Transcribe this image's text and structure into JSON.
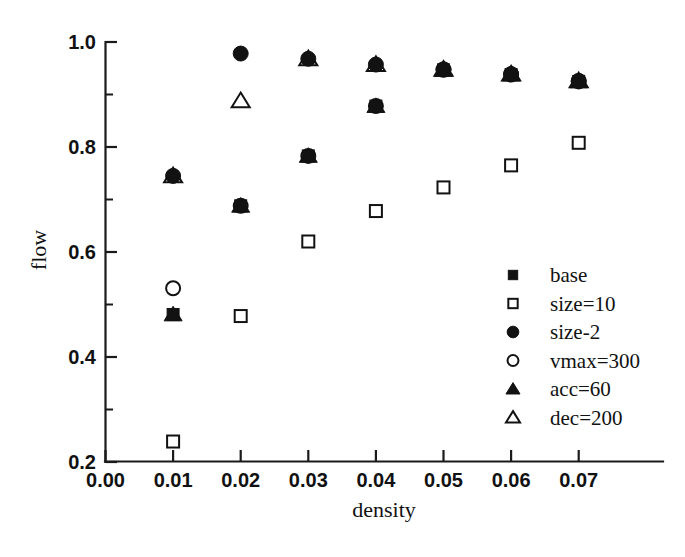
{
  "chart_data": {
    "type": "scatter",
    "title": "",
    "xlabel": "density",
    "ylabel": "flow",
    "xlim": [
      0.0,
      0.0815
    ],
    "ylim": [
      0.155,
      1.02
    ],
    "grid": false,
    "legend_position": "center-right",
    "x_ticks": [
      "0.00",
      "0.01",
      "0.02",
      "0.03",
      "0.04",
      "0.05",
      "0.06",
      "0.07"
    ],
    "x_tick_values": [
      0.0,
      0.01,
      0.02,
      0.03,
      0.04,
      0.05,
      0.06,
      0.07
    ],
    "y_ticks": [
      "0.2",
      "0.4",
      "0.6",
      "0.8",
      "1.0"
    ],
    "y_tick_values": [
      0.2,
      0.4,
      0.6,
      0.8,
      1.0
    ],
    "y_minor_ticks": [
      0.3,
      0.5,
      0.7,
      0.9
    ],
    "x": [
      0.01,
      0.02,
      0.03,
      0.04,
      0.05,
      0.06,
      0.07
    ],
    "series": [
      {
        "name": "base",
        "marker": "filled-square",
        "values": [
          0.481,
          0.688,
          0.783,
          0.878,
          0.947,
          0.938,
          0.925
        ]
      },
      {
        "name": "size=10",
        "marker": "open-square",
        "values": [
          0.239,
          0.478,
          0.62,
          0.678,
          0.723,
          0.765,
          0.808
        ]
      },
      {
        "name": "size-2",
        "marker": "filled-circle",
        "values": [
          0.745,
          0.978,
          0.968,
          0.957,
          0.948,
          0.939,
          0.926
        ]
      },
      {
        "name": "vmax=300",
        "marker": "open-circle",
        "values": [
          0.531,
          0.688,
          0.783,
          0.878,
          0.947,
          0.938,
          0.925
        ]
      },
      {
        "name": "acc=60",
        "marker": "filled-triangle",
        "values": [
          0.481,
          0.688,
          0.783,
          0.878,
          0.947,
          0.938,
          0.925
        ]
      },
      {
        "name": "dec=200",
        "marker": "open-triangle",
        "values": [
          0.745,
          0.888,
          0.968,
          0.957,
          0.948,
          0.939,
          0.926
        ]
      }
    ]
  },
  "legend": {
    "entries": [
      {
        "label": "base",
        "marker": "filled-square"
      },
      {
        "label": "size=10",
        "marker": "open-square"
      },
      {
        "label": "size-2",
        "marker": "filled-circle"
      },
      {
        "label": "vmax=300",
        "marker": "open-circle"
      },
      {
        "label": "acc=60",
        "marker": "filled-triangle"
      },
      {
        "label": "dec=200",
        "marker": "open-triangle"
      }
    ]
  },
  "colors": {
    "marker": "#121212",
    "axis": "#1a1a1a",
    "background": "#ffffff"
  }
}
